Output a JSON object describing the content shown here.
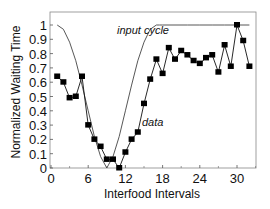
{
  "chart_data": {
    "type": "line",
    "title": "",
    "xlabel": "Interfood Intervals",
    "ylabel": "Normalized Waiting Time",
    "xlim": [
      0,
      33
    ],
    "ylim": [
      0,
      1.07
    ],
    "xticks": [
      0,
      6,
      12,
      18,
      24,
      30
    ],
    "xtick_labels": [
      "0",
      "6",
      "12",
      "18",
      "24",
      "30"
    ],
    "xminor_ticks": [
      3,
      9,
      15,
      21,
      27,
      33
    ],
    "yticks": [
      0,
      0.1,
      0.2,
      0.3,
      0.4,
      0.5,
      0.6,
      0.7,
      0.8,
      0.9,
      1
    ],
    "ytick_labels": [
      "0",
      "0.1",
      "0.2",
      "0.3",
      "0.4",
      "0.5",
      "0.6",
      "0.7",
      "0.8",
      "0.9",
      "1"
    ],
    "grid": false,
    "legend": "none (inline annotations)",
    "series": [
      {
        "name": "data",
        "style": "line-with-square-markers",
        "color": "#111111",
        "x": [
          1,
          2,
          3,
          4,
          5,
          6,
          7,
          8,
          9,
          10,
          11,
          12,
          13,
          14,
          15,
          16,
          17,
          18,
          19,
          20,
          21,
          22,
          23,
          24,
          25,
          26,
          27,
          28,
          29,
          30,
          31,
          32
        ],
        "values": [
          0.64,
          0.6,
          0.49,
          0.5,
          0.64,
          0.3,
          0.2,
          0.15,
          0.06,
          0.06,
          0.0,
          0.11,
          0.2,
          0.25,
          0.45,
          0.62,
          0.76,
          0.66,
          0.84,
          0.76,
          0.82,
          0.79,
          0.75,
          0.73,
          0.77,
          0.79,
          0.67,
          0.86,
          0.71,
          1.0,
          0.89,
          0.71
        ]
      },
      {
        "name": "input cycle",
        "style": "thin-line",
        "color": "#444444",
        "x": [
          1,
          2,
          3,
          4,
          5,
          6,
          7,
          8,
          9,
          10,
          11,
          12,
          13,
          14,
          15,
          16,
          17,
          17.5,
          18,
          20,
          22,
          24,
          26,
          28,
          30,
          32
        ],
        "values": [
          1.0,
          0.97,
          0.88,
          0.75,
          0.58,
          0.4,
          0.22,
          0.08,
          0.0,
          0.08,
          0.22,
          0.4,
          0.58,
          0.75,
          0.88,
          0.97,
          1.0,
          1.0,
          1.0,
          1.0,
          1.0,
          1.0,
          1.0,
          1.0,
          1.0,
          1.0
        ]
      }
    ],
    "annotations": [
      {
        "text": "input cycle",
        "x": 17,
        "y": 0.95
      },
      {
        "text": "data",
        "x": 16,
        "y": 0.38
      }
    ]
  }
}
